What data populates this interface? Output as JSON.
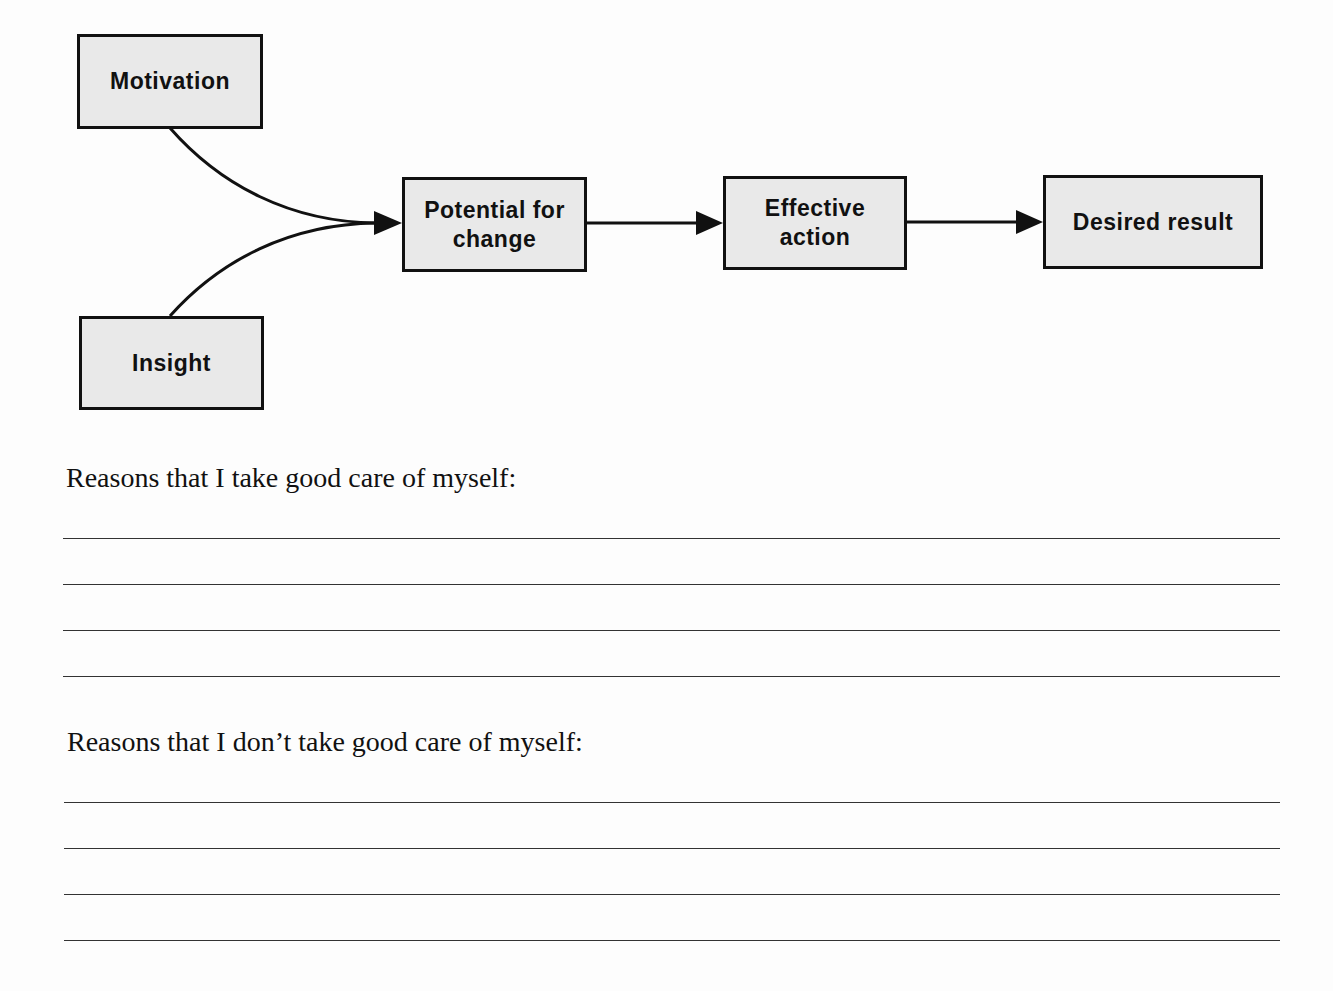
{
  "diagram": {
    "nodes": [
      {
        "id": "motivation",
        "label": "Motivation"
      },
      {
        "id": "insight",
        "label": "Insight"
      },
      {
        "id": "potential",
        "label": "Potential for\nchange"
      },
      {
        "id": "effective",
        "label": "Effective\naction"
      },
      {
        "id": "desired",
        "label": "Desired result"
      }
    ],
    "edges": [
      {
        "from": "motivation",
        "to": "potential"
      },
      {
        "from": "insight",
        "to": "potential"
      },
      {
        "from": "potential",
        "to": "effective"
      },
      {
        "from": "effective",
        "to": "desired"
      }
    ],
    "colors": {
      "box_fill": "#e9e9e9",
      "stroke": "#111111"
    }
  },
  "sections": [
    {
      "prompt": "Reasons that I take good care of myself:",
      "blank_lines": 4
    },
    {
      "prompt": "Reasons that I don’t take good care of myself:",
      "blank_lines": 4
    }
  ]
}
